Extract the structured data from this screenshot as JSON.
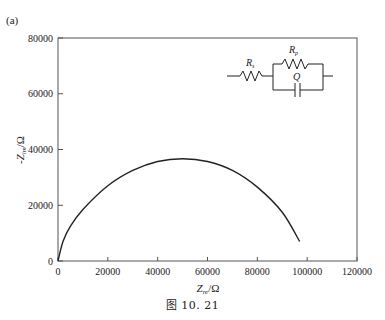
{
  "panel_label": "(a)",
  "caption": "图 10. 21",
  "circuit": {
    "labels": [
      "R_s",
      "R_p",
      "Q"
    ],
    "description": "Rs in series with (Rp parallel Q)"
  },
  "chart_data": {
    "type": "line",
    "title": "",
    "xlabel": "Z_re/Ω",
    "ylabel": "-Z_im/Ω",
    "xlim": [
      0,
      120000
    ],
    "ylim": [
      0,
      80000
    ],
    "x_ticks": [
      0,
      20000,
      40000,
      60000,
      80000,
      100000,
      120000
    ],
    "y_ticks": [
      0,
      20000,
      40000,
      60000,
      80000
    ],
    "grid": false,
    "legend": null,
    "series": [
      {
        "name": "Nyquist impedance",
        "x": [
          0,
          2000,
          5000,
          10000,
          20000,
          30000,
          40000,
          50000,
          60000,
          70000,
          80000,
          90000,
          97000
        ],
        "y": [
          0,
          7000,
          12500,
          18500,
          27000,
          32500,
          35700,
          36700,
          35700,
          32500,
          26500,
          17500,
          7000
        ]
      }
    ]
  }
}
